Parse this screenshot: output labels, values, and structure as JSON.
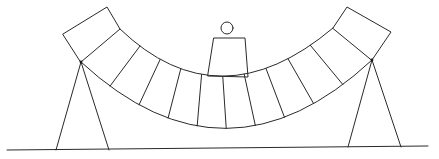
{
  "diagram": {
    "type": "line-drawing",
    "colors": {
      "background": "#ffffff",
      "line": "#2a2a2a"
    },
    "ground": {
      "x1": 7,
      "y1": 150,
      "x2": 428,
      "y2": 146
    },
    "beam": {
      "segment_count": 12,
      "inner_edge": {
        "start": [
          120,
          29
        ],
        "control": [
          219,
          124
        ],
        "end": [
          333,
          28
        ]
      },
      "outer_edge": {
        "start": [
          81,
          62
        ],
        "control": [
          226,
          196
        ],
        "end": [
          372,
          60
        ]
      },
      "end_blocks": {
        "left": [
          [
            63,
            34
          ],
          [
            107,
            7
          ],
          [
            120,
            29
          ],
          [
            81,
            62
          ]
        ],
        "right": [
          [
            333,
            28
          ],
          [
            347,
            7
          ],
          [
            391,
            32
          ],
          [
            372,
            60
          ]
        ]
      }
    },
    "supports": [
      {
        "name": "left",
        "apex": [
          81,
          62
        ],
        "feet": [
          [
            56,
            150
          ],
          [
            109,
            150
          ]
        ]
      },
      {
        "name": "right",
        "apex": [
          372,
          60
        ],
        "feet": [
          [
            348,
            147
          ],
          [
            401,
            147
          ]
        ]
      }
    ],
    "figure": {
      "head": {
        "cx": 227,
        "cy": 28,
        "r": 6
      },
      "body": [
        [
          214,
          38
        ],
        [
          245,
          38
        ],
        [
          248,
          77
        ],
        [
          208,
          76
        ]
      ]
    }
  }
}
